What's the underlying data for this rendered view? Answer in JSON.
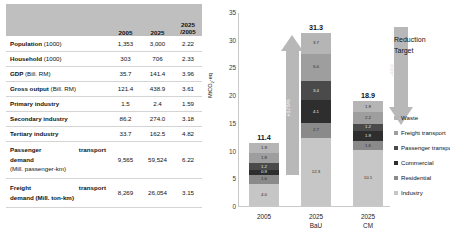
{
  "table": {
    "headers": [
      "",
      "2005",
      "2025",
      "2025",
      "/2005"
    ],
    "header_col3_line1": "2025",
    "header_col3_line2": "/2005",
    "rows": [
      {
        "label": "Population",
        "unit": "(1000)",
        "v2005": "1,353",
        "v2025": "3,000",
        "ratio": "2.22",
        "indent": false
      },
      {
        "label": "Household",
        "unit": "(1000)",
        "v2005": "303",
        "v2025": "706",
        "ratio": "2.33",
        "indent": false
      },
      {
        "label": "GDP",
        "unit": "(Bill. RM)",
        "v2005": "35.7",
        "v2025": "141.4",
        "ratio": "3.96",
        "indent": false
      },
      {
        "label": "Gross output",
        "unit": "(Bill. RM)",
        "v2005": "121.4",
        "v2025": "438.9",
        "ratio": "3.61",
        "indent": false
      },
      {
        "label": "Primary industry",
        "unit": "",
        "v2005": "1.5",
        "v2025": "2.4",
        "ratio": "1.59",
        "indent": true
      },
      {
        "label": "Secondary industry",
        "unit": "",
        "v2005": "86.2",
        "v2025": "274.0",
        "ratio": "3.18",
        "indent": true
      },
      {
        "label": "Tertiary industry",
        "unit": "",
        "v2005": "33.7",
        "v2025": "162.5",
        "ratio": "4.82",
        "indent": true
      }
    ],
    "passenger": {
      "line1a": "Passenger",
      "line1b": "transport",
      "line2": "demand",
      "line3": "(Mill. passenger-km)",
      "v2005": "9,565",
      "v2025": "59,524",
      "ratio": "6.22"
    },
    "freight": {
      "line1a": "Freight",
      "line1b": "transport",
      "line2": "demand (Mill. ton-km)",
      "v2005": "8,269",
      "v2025": "26,054",
      "ratio": "3.15"
    }
  },
  "chart_data": {
    "type": "bar",
    "stacked": true,
    "title": "",
    "xlabel": "",
    "ylabel": "MtCO2-eq",
    "ylim": [
      0,
      35
    ],
    "yticks": [
      "0",
      "5",
      "10",
      "15",
      "20",
      "25",
      "30",
      "35"
    ],
    "categories": [
      "2005",
      "2025 BaU",
      "2025 CM"
    ],
    "category_lines": [
      {
        "l1": "2005",
        "l2": ""
      },
      {
        "l1": "2025",
        "l2": "BaU"
      },
      {
        "l1": "2025",
        "l2": "CM"
      }
    ],
    "totals": [
      "11.4",
      "31.3",
      "18.9"
    ],
    "total_values": [
      11.4,
      31.3,
      18.9
    ],
    "series": [
      {
        "name": "Industry",
        "color": "#c6c6c6",
        "values": [
          4.0,
          12.3,
          10.1
        ]
      },
      {
        "name": "Residential",
        "color": "#8a8a8a",
        "values": [
          1.6,
          2.7,
          1.6
        ]
      },
      {
        "name": "Commercial",
        "color": "#2e2e2e",
        "values": [
          0.9,
          4.1,
          1.9
        ]
      },
      {
        "name": "Passenger transport",
        "color": "#4a4a4a",
        "values": [
          1.2,
          3.4,
          1.2
        ]
      },
      {
        "name": "Freight transport",
        "color": "#9e9e9e",
        "values": [
          1.8,
          5.0,
          2.2
        ]
      },
      {
        "name": "Waste",
        "color": "#b5b5b5",
        "values": [
          1.9,
          3.7,
          1.9
        ]
      }
    ],
    "legend_position": "right",
    "legend": [
      "Waste",
      "Freight transport",
      "Passenger transport",
      "Commercial",
      "Residential",
      "Industry"
    ],
    "annotations": {
      "up_arrow_label": "+175%",
      "down_arrow_label": "-40%",
      "reduction_line1": "Reduction",
      "reduction_line2": "Target"
    }
  }
}
